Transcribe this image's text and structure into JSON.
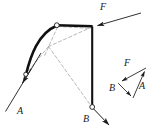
{
  "figure": {
    "type": "mechanics-free-body-diagram",
    "background_color": "#ffffff",
    "stroke_color": "#1a1a1a",
    "dashed_color": "#9a9a9a",
    "labels": {
      "main_F": "F",
      "main_A": "A",
      "main_B": "B",
      "triangle_F": "F",
      "triangle_A": "A",
      "triangle_B": "B"
    },
    "main_diagram": {
      "arc": {
        "description": "bold curved member from lower-left pin to upper joint",
        "start": [
          26,
          74
        ],
        "control": [
          38,
          30
        ],
        "end": [
          57,
          25
        ]
      },
      "top_bar": {
        "description": "bold horizontal member from arc top joint to vertical member",
        "from": [
          57,
          25
        ],
        "to": [
          92,
          26
        ]
      },
      "vertical_bar": {
        "description": "bold vertical member from joint down to pin B",
        "from": [
          92,
          26
        ],
        "to": [
          92,
          107
        ]
      },
      "pins": [
        {
          "name": "pin-a",
          "at": [
            26,
            74
          ],
          "style": "open-circle"
        },
        {
          "name": "joint-top",
          "at": [
            57,
            25
          ],
          "style": "open-circle"
        },
        {
          "name": "pin-b",
          "at": [
            92,
            107
          ],
          "style": "open-circle"
        }
      ],
      "force_vectors": [
        {
          "name": "force-F",
          "label": "F",
          "from": [
            141,
            13
          ],
          "to": [
            93,
            27
          ],
          "arrow_at": "to"
        },
        {
          "name": "force-A",
          "label": "A",
          "from": [
            35,
            63
          ],
          "to": [
            5,
            112
          ],
          "arrow_at": "from"
        },
        {
          "name": "force-B",
          "label": "B",
          "from": [
            92,
            107
          ],
          "to": [
            110,
            126
          ],
          "arrow_at": "to"
        }
      ],
      "construction_lines": [
        {
          "name": "dashed-top-to-hinge",
          "from": [
            57,
            25
          ],
          "to": [
            92,
            26
          ]
        },
        {
          "name": "dashed-joint-to-instant-center",
          "from": [
            92,
            26
          ],
          "to": [
            49,
            46
          ]
        },
        {
          "name": "dashed-instant-center-to-a",
          "from": [
            49,
            46
          ],
          "to": [
            26,
            74
          ]
        },
        {
          "name": "dashed-instant-center-to-b",
          "from": [
            49,
            46
          ],
          "to": [
            92,
            107
          ]
        },
        {
          "name": "dashed-arc-top-to-center",
          "from": [
            57,
            25
          ],
          "to": [
            45,
            55
          ]
        }
      ]
    },
    "force_triangle": {
      "description": "closed force polygon of F, A and B at lower right",
      "vertices": {
        "apex": [
          146,
          68
        ],
        "left": [
          118,
          83
        ],
        "bottom": [
          133,
          98
        ]
      },
      "sides": [
        {
          "name": "triangle-side-F",
          "label": "F",
          "from": [
            146,
            68
          ],
          "to": [
            118,
            83
          ],
          "arrow_at": "to"
        },
        {
          "name": "triangle-side-B",
          "label": "B",
          "from": [
            118,
            83
          ],
          "to": [
            133,
            98
          ],
          "arrow_at": "to"
        },
        {
          "name": "triangle-side-A",
          "label": "A",
          "from": [
            133,
            98
          ],
          "to": [
            146,
            68
          ],
          "arrow_at": "to"
        }
      ]
    },
    "label_positions": {
      "main_F": [
        100,
        4
      ],
      "main_A": [
        17,
        110
      ],
      "main_B": [
        83,
        120
      ],
      "triangle_F": [
        124,
        60
      ],
      "triangle_A": [
        139,
        85
      ],
      "triangle_B": [
        110,
        87
      ]
    }
  }
}
